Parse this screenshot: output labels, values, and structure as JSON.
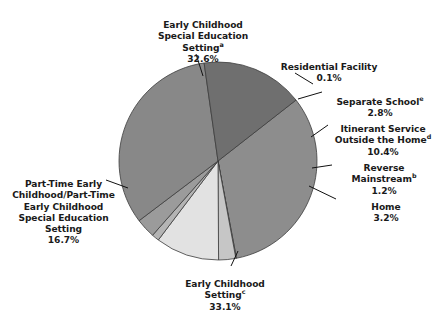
{
  "chart_data": {
    "type": "pie",
    "title": "",
    "subtitle": "",
    "xlabel": "",
    "ylabel": "",
    "legend_position": "none",
    "grid": false,
    "units": "percent",
    "total": 100.1,
    "categories": [
      "Early Childhood Special Education Setting",
      "Residential Facility",
      "Separate School",
      "Itinerant Service Outside the Home",
      "Reverse Mainstream",
      "Home",
      "Early Childhood Setting",
      "Part-Time Early Childhood/Part-Time Early Childhood Special Education Setting"
    ],
    "values": [
      32.6,
      0.1,
      2.8,
      10.4,
      1.2,
      3.2,
      33.1,
      16.7
    ],
    "slices": [
      {
        "key": "ecse",
        "name": "Early Childhood Special Education Setting",
        "lines": [
          "Early Childhood",
          "Special Education",
          "Setting"
        ],
        "footnote": "a",
        "value": 32.6,
        "value_label": "32.6%",
        "color": "#8d8d8d"
      },
      {
        "key": "residential",
        "name": "Residential Facility",
        "lines": [
          "Residential Facility"
        ],
        "footnote": "",
        "value": 0.1,
        "value_label": "0.1%",
        "color": "#d2d2d2"
      },
      {
        "key": "separate-school",
        "name": "Separate School",
        "lines": [
          "Separate School"
        ],
        "footnote": "e",
        "value": 2.8,
        "value_label": "2.8%",
        "color": "#c6c6c6"
      },
      {
        "key": "itinerant",
        "name": "Itinerant Service Outside the Home",
        "lines": [
          "Itinerant Service",
          "Outside the Home"
        ],
        "footnote": "d",
        "value": 10.4,
        "value_label": "10.4%",
        "color": "#e2e2e2"
      },
      {
        "key": "reverse-mainstream",
        "name": "Reverse Mainstream",
        "lines": [
          "Reverse",
          "Mainstream"
        ],
        "footnote": "b",
        "value": 1.2,
        "value_label": "1.2%",
        "color": "#b4b4b4"
      },
      {
        "key": "home",
        "name": "Home",
        "lines": [
          "Home"
        ],
        "footnote": "",
        "value": 3.2,
        "value_label": "3.2%",
        "color": "#9b9b9b"
      },
      {
        "key": "ec-setting",
        "name": "Early Childhood Setting",
        "lines": [
          "Early Childhood",
          "Setting"
        ],
        "footnote": "c",
        "value": 33.1,
        "value_label": "33.1%",
        "color": "#888888"
      },
      {
        "key": "part-time",
        "name": "Part-Time Early Childhood/Part-Time Early Childhood Special Education Setting",
        "lines": [
          "Part-Time Early",
          "Childhood/Part-Time",
          "Early Childhood",
          "Special Education",
          "Setting"
        ],
        "footnote": "",
        "value": 16.7,
        "value_label": "16.7%",
        "color": "#6f6f6f"
      }
    ],
    "geometry": {
      "center_x": 218,
      "center_y": 161,
      "radius": 99,
      "start_angle_deg": -38,
      "direction": "clockwise"
    },
    "colors": {
      "background": "#ffffff",
      "text": "#1a1a1a",
      "outline": "#3c3c3c",
      "leader": "#111111"
    }
  }
}
